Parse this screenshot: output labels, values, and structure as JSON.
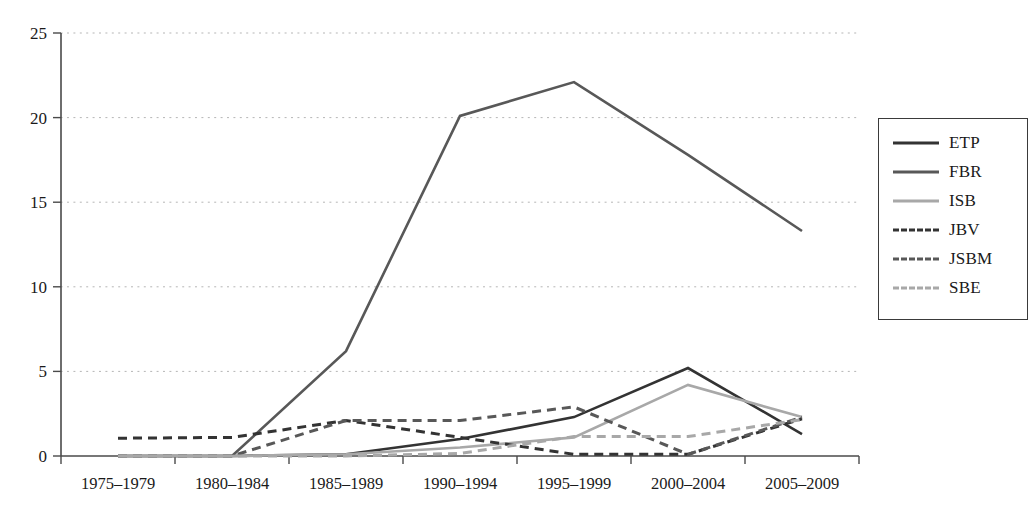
{
  "chart_data": {
    "type": "line",
    "title": "",
    "xlabel": "",
    "ylabel": "",
    "grid": true,
    "legend_position": "right",
    "ylim": [
      0,
      25
    ],
    "yticks": [
      0,
      5,
      10,
      15,
      20,
      25
    ],
    "ytick_labels": [
      "0",
      "5",
      "10",
      "15",
      "20",
      "25"
    ],
    "categories": [
      "1975–1979",
      "1980–1984",
      "1985–1989",
      "1990–1994",
      "1995–1999",
      "2000–2004",
      "2005–2009"
    ],
    "series": [
      {
        "name": "ETP",
        "style": "solid",
        "color": "#333333",
        "values": [
          0,
          0,
          0.1,
          1.0,
          2.3,
          5.2,
          1.3
        ]
      },
      {
        "name": "FBR",
        "style": "solid",
        "color": "#585858",
        "values": [
          0,
          0,
          6.2,
          20.1,
          22.1,
          17.8,
          13.3
        ]
      },
      {
        "name": "ISB",
        "style": "solid",
        "color": "#a8a8a8",
        "values": [
          0,
          0,
          0.1,
          0.5,
          1.1,
          4.2,
          2.3
        ]
      },
      {
        "name": "JBV",
        "style": "dashed",
        "color": "#333333",
        "values": [
          1.05,
          1.1,
          2.1,
          1.1,
          0.1,
          0.1,
          2.2
        ]
      },
      {
        "name": "JSBM",
        "style": "dashed",
        "color": "#585858",
        "values": [
          0,
          0,
          2.1,
          2.1,
          2.9,
          0.1,
          2.3
        ]
      },
      {
        "name": "SBE",
        "style": "dashed",
        "color": "#a8a8a8",
        "values": [
          0,
          0,
          0,
          0.15,
          1.15,
          1.15,
          2.15
        ]
      }
    ]
  },
  "legend": {
    "items": [
      {
        "label": "ETP"
      },
      {
        "label": "FBR"
      },
      {
        "label": "ISB"
      },
      {
        "label": "JBV"
      },
      {
        "label": "JSBM"
      },
      {
        "label": "SBE"
      }
    ]
  },
  "axes": {
    "axis_color": "#4a4a4a",
    "grid_color": "#b5b5b5"
  }
}
